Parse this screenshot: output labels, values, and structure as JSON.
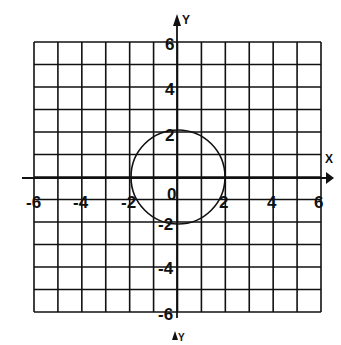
{
  "diagram": {
    "type": "coordinate-plane",
    "x_axis_label": "X",
    "y_axis_label": "Y",
    "second_y_axis_label": "Y",
    "x_range": [
      -6,
      6
    ],
    "y_range": [
      -6,
      6
    ],
    "grid_step": 1,
    "x_tick_labels": [
      "-6",
      "-4",
      "-2",
      "2",
      "4",
      "6"
    ],
    "y_tick_labels": [
      "6",
      "4",
      "2",
      "-2",
      "-4",
      "-6"
    ],
    "origin_label": "0",
    "shape": {
      "type": "circle",
      "center": [
        0,
        0
      ],
      "radius": 2
    }
  }
}
